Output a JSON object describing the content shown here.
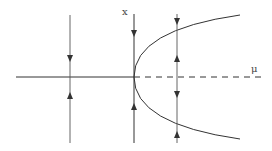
{
  "diagram": {
    "type": "pitchfork-bifurcation",
    "labels": {
      "vertical_axis": "x",
      "horizontal_axis": "μ"
    },
    "colors": {
      "line": "#333333",
      "background": "#ffffff"
    },
    "branches": [
      {
        "name": "stable-trivial",
        "style": "solid",
        "from_mu": "left",
        "to_mu": 0
      },
      {
        "name": "unstable-trivial",
        "style": "dashed",
        "from_mu": 0,
        "to_mu": "right"
      },
      {
        "name": "upper-stable-branch",
        "style": "solid",
        "shape": "x = +sqrt(mu)"
      },
      {
        "name": "lower-stable-branch",
        "style": "solid",
        "shape": "x = -sqrt(mu)"
      }
    ],
    "flow_lines": [
      {
        "position": "mu<0",
        "arrows": [
          "down-toward-axis",
          "up-toward-axis"
        ]
      },
      {
        "position": "mu=0",
        "arrows": [
          "down-toward-axis",
          "up-toward-axis"
        ]
      },
      {
        "position": "mu>0",
        "arrows": [
          "down",
          "up",
          "down",
          "up"
        ]
      }
    ]
  }
}
